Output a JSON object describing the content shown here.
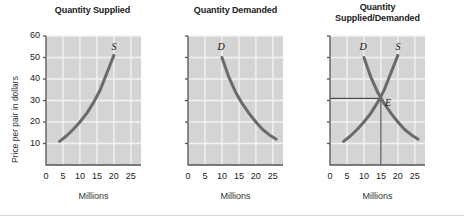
{
  "figure": {
    "background_color": "#ffffff",
    "plot_background_color": "#d4d4d4",
    "gridline_color": "#f2f2f2",
    "axis_color": "#555555",
    "curve_color": "#6a6a6a",
    "equilibrium_line_color": "#333333",
    "y_axis_label": "Price per pair in dollars",
    "x_axis_label": "Millions",
    "y_ticks": [
      "10",
      "20",
      "30",
      "40",
      "50",
      "60"
    ],
    "x_ticks": [
      "0",
      "5",
      "10",
      "15",
      "20",
      "25"
    ],
    "x_origin_label": "0"
  },
  "chart_data": [
    {
      "type": "line",
      "title": "Quantity Supplied",
      "xlabel": "Millions",
      "ylabel": "Price per pair in dollars",
      "xlim": [
        0,
        28
      ],
      "ylim": [
        0,
        60
      ],
      "xticks": [
        0,
        5,
        10,
        15,
        20,
        25
      ],
      "yticks": [
        10,
        20,
        30,
        40,
        50,
        60
      ],
      "grid": true,
      "legend": "none",
      "series": [
        {
          "name": "S",
          "label": "S",
          "label_x": 20.2,
          "label_y": 55,
          "x": [
            4.0,
            6.0,
            8.0,
            10.0,
            12.0,
            14.0,
            16.0,
            18.0,
            19.0,
            20.0
          ],
          "y": [
            11.0,
            13.5,
            16.5,
            20.0,
            24.0,
            29.0,
            35.0,
            43.0,
            47.0,
            51.0
          ]
        }
      ]
    },
    {
      "type": "line",
      "title": "Quantity Demanded",
      "xlabel": "Millions",
      "ylabel": "Price per pair in dollars",
      "xlim": [
        0,
        28
      ],
      "ylim": [
        0,
        60
      ],
      "xticks": [
        0,
        5,
        10,
        15,
        20,
        25
      ],
      "yticks": [
        10,
        20,
        30,
        40,
        50,
        60
      ],
      "grid": true,
      "legend": "none",
      "series": [
        {
          "name": "D",
          "label": "D",
          "label_x": 9.6,
          "label_y": 55,
          "x": [
            10.0,
            12.0,
            14.0,
            16.0,
            18.0,
            20.0,
            22.0,
            24.0,
            26.0
          ],
          "y": [
            50.0,
            41.0,
            34.0,
            28.5,
            24.0,
            20.0,
            16.5,
            14.0,
            12.0
          ]
        }
      ]
    },
    {
      "type": "line",
      "title": "Quantity Supplied/Demanded",
      "title_line1": "Quantity",
      "title_line2": "Supplied/Demanded",
      "xlabel": "Millions",
      "ylabel": "Price per pair in dollars",
      "xlim": [
        0,
        28
      ],
      "ylim": [
        0,
        60
      ],
      "xticks": [
        0,
        5,
        10,
        15,
        20,
        25
      ],
      "yticks": [
        10,
        20,
        30,
        40,
        50,
        60
      ],
      "grid": true,
      "legend": "none",
      "series": [
        {
          "name": "S",
          "label": "S",
          "label_x": 20.2,
          "label_y": 55,
          "x": [
            4.0,
            6.0,
            8.0,
            10.0,
            12.0,
            14.0,
            16.0,
            18.0,
            19.0,
            20.0
          ],
          "y": [
            11.0,
            13.5,
            16.5,
            20.0,
            24.0,
            29.0,
            35.0,
            43.0,
            47.0,
            51.0
          ]
        },
        {
          "name": "D",
          "label": "D",
          "label_x": 9.6,
          "label_y": 55,
          "x": [
            10.0,
            12.0,
            14.0,
            16.0,
            18.0,
            20.0,
            22.0,
            24.0,
            26.0
          ],
          "y": [
            50.0,
            41.0,
            34.0,
            28.5,
            24.0,
            20.0,
            16.5,
            14.0,
            12.0
          ]
        }
      ],
      "annotations": [
        {
          "name": "equilibrium",
          "label": "E",
          "x": 15.0,
          "y": 31.0,
          "label_x": 16.2,
          "label_y": 29.0,
          "horizontal_line_to_y_axis": true,
          "vertical_line_to_x_axis": true
        }
      ]
    }
  ]
}
